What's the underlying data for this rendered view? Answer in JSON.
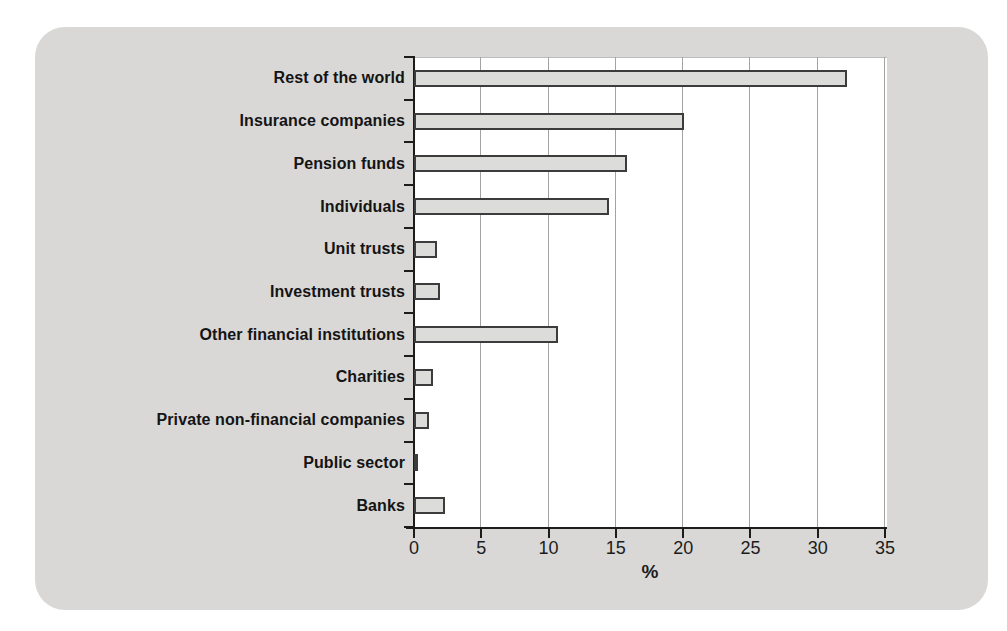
{
  "figure": {
    "background_color": "#ffffff",
    "panel_color": "#d9d8d6"
  },
  "chart_data": {
    "type": "bar",
    "orientation": "horizontal",
    "title": "",
    "categories": [
      "Rest of the world",
      "Insurance companies",
      "Pension funds",
      "Individuals",
      "Unit trusts",
      "Investment trusts",
      "Other financial institutions",
      "Charities",
      "Private non-financial companies",
      "Public sector",
      "Banks"
    ],
    "values": [
      32.2,
      20.1,
      15.8,
      14.5,
      1.7,
      1.9,
      10.7,
      1.4,
      1.1,
      0.3,
      2.3
    ],
    "xlabel": "%",
    "ylabel": "",
    "xlim": [
      0,
      35
    ],
    "xticks": [
      0,
      5,
      10,
      15,
      20,
      25,
      30,
      35
    ],
    "grid": "vertical gridlines at every x tick",
    "legend": "none",
    "bar_fill_color": "#dcdcda",
    "bar_border_color": "#3c3c3c",
    "gridline_color": "#a3a3a1",
    "axis_color": "#1c1c1c",
    "text_color": "#141414"
  }
}
